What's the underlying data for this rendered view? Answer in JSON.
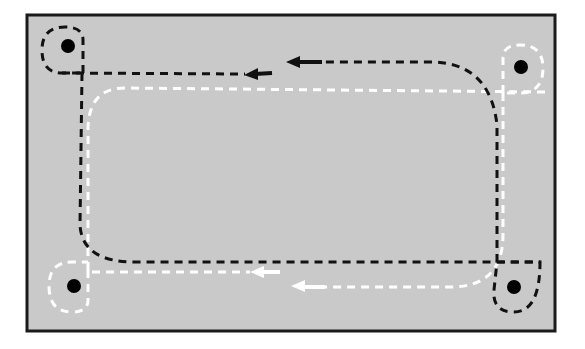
{
  "diagram": {
    "type": "circulation-path-diagram",
    "frame": {
      "x": 27,
      "y": 15,
      "width": 528,
      "height": 316,
      "fill": "#c9c9c9",
      "stroke": "#1a1a1a"
    },
    "colors": {
      "background": "#ffffff",
      "panel": "#c9c9c9",
      "dark_path": "#111111",
      "light_path": "#ffffff",
      "node": "#000000"
    },
    "nodes": [
      {
        "id": "top-left",
        "cx": 68,
        "cy": 46,
        "ring": "dark"
      },
      {
        "id": "top-right",
        "cx": 521,
        "cy": 67,
        "ring": "light"
      },
      {
        "id": "bottom-left",
        "cx": 74,
        "cy": 286,
        "ring": "light"
      },
      {
        "id": "bottom-right",
        "cx": 514,
        "cy": 287,
        "ring": "dark"
      }
    ],
    "paths": [
      {
        "id": "dark-loop",
        "color": "dark",
        "direction": "counter-clockwise",
        "arrows": 2
      },
      {
        "id": "light-loop",
        "color": "light",
        "direction": "counter-clockwise",
        "arrows": 2
      }
    ],
    "arrows": [
      {
        "color": "dark",
        "x": 245,
        "y": 74,
        "points": "left"
      },
      {
        "color": "dark",
        "x": 287,
        "y": 62,
        "points": "left"
      },
      {
        "color": "light",
        "x": 252,
        "y": 272,
        "points": "left"
      },
      {
        "color": "light",
        "x": 292,
        "y": 286,
        "points": "left"
      }
    ]
  }
}
